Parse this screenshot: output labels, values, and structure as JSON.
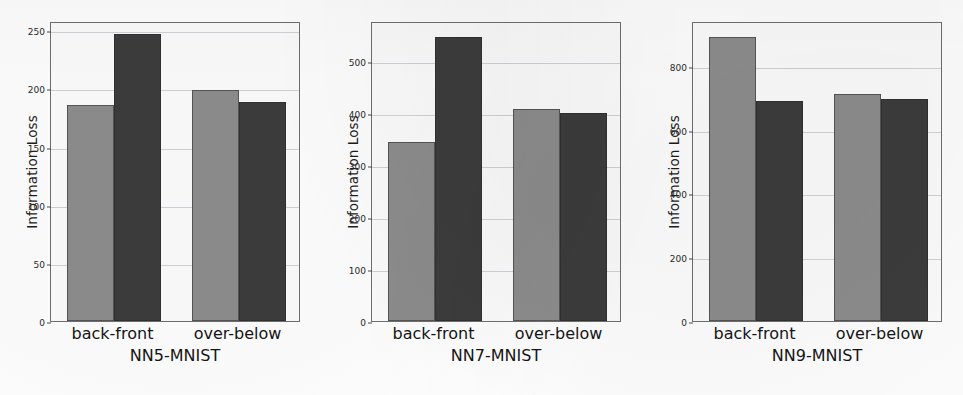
{
  "chart_data": [
    {
      "type": "bar",
      "title": "",
      "xlabel": "NN5-MNIST",
      "ylabel": "Information Loss",
      "categories": [
        "back-front",
        "over-below"
      ],
      "series": [
        {
          "name": "light",
          "color": "#8d8d8d",
          "values": [
            186,
            199
          ]
        },
        {
          "name": "dark",
          "color": "#3c3c3c",
          "values": [
            247,
            188
          ]
        }
      ],
      "ylim": [
        0,
        258
      ],
      "yticks": [
        0,
        50,
        100,
        150,
        200,
        250
      ],
      "ytick_labels": [
        "0",
        "50",
        "100",
        "150",
        "200",
        "250"
      ],
      "grid": true,
      "legend": "none"
    },
    {
      "type": "bar",
      "title": "",
      "xlabel": "NN7-MNIST",
      "ylabel": "Information Loss",
      "categories": [
        "back-front",
        "over-below"
      ],
      "series": [
        {
          "name": "light",
          "color": "#8d8d8d",
          "values": [
            344,
            408
          ]
        },
        {
          "name": "dark",
          "color": "#3c3c3c",
          "values": [
            548,
            400
          ]
        }
      ],
      "ylim": [
        0,
        578
      ],
      "yticks": [
        0,
        100,
        200,
        300,
        400,
        500
      ],
      "ytick_labels": [
        "0",
        "100",
        "200",
        "300",
        "400",
        "500"
      ],
      "grid": true,
      "legend": "none"
    },
    {
      "type": "bar",
      "title": "",
      "xlabel": "NN9-MNIST",
      "ylabel": "Information Loss",
      "categories": [
        "back-front",
        "over-below"
      ],
      "series": [
        {
          "name": "light",
          "color": "#8d8d8d",
          "values": [
            890,
            712
          ]
        },
        {
          "name": "dark",
          "color": "#3c3c3c",
          "values": [
            688,
            696
          ]
        }
      ],
      "ylim": [
        0,
        940
      ],
      "yticks": [
        0,
        200,
        400,
        600,
        800
      ],
      "ytick_labels": [
        "0",
        "200",
        "400",
        "600",
        "800"
      ],
      "grid": true,
      "legend": "none"
    }
  ],
  "panels": [
    {
      "ylabel": "Information Loss",
      "xlabel": "NN5-MNIST",
      "xtick_labels": [
        "back-front",
        "over-below"
      ]
    },
    {
      "ylabel": "Information Loss",
      "xlabel": "NN7-MNIST",
      "xtick_labels": [
        "back-front",
        "over-below"
      ]
    },
    {
      "ylabel": "Information Loss",
      "xlabel": "NN9-MNIST",
      "xtick_labels": [
        "back-front",
        "over-below"
      ]
    }
  ],
  "colors": {
    "light_bar": "#8d8d8d",
    "dark_bar": "#3c3c3c",
    "axis": "#6f6f6f",
    "grid": "#b4b4c0",
    "background": "#ffffff"
  }
}
